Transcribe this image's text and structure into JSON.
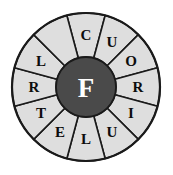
{
  "figure": {
    "name": "letter-wheel",
    "center_letter": "F",
    "sector_count": 12,
    "colors": {
      "sector_fill": "#dedede",
      "hub_fill": "#4a4a4a",
      "outline": "#1a1a1a",
      "sector_letter_color": "#0d0d0d",
      "hub_letter_color": "#ffffff",
      "background": "#ffffff"
    },
    "geometry": {
      "center_x": 86,
      "center_y": 87,
      "outer_radius": 74,
      "hub_radius": 30,
      "letter_radius": 52,
      "sector_span_degrees": 30,
      "first_sector_start_degrees": -15
    },
    "sectors": [
      {
        "index": 0,
        "letter": "C",
        "angle_degrees": 0,
        "empty": false
      },
      {
        "index": 1,
        "letter": "U",
        "angle_degrees": 30,
        "empty": false
      },
      {
        "index": 2,
        "letter": "O",
        "angle_degrees": 60,
        "empty": false
      },
      {
        "index": 3,
        "letter": "R",
        "angle_degrees": 90,
        "empty": false
      },
      {
        "index": 4,
        "letter": "I",
        "angle_degrees": 120,
        "empty": false
      },
      {
        "index": 5,
        "letter": "U",
        "angle_degrees": 150,
        "empty": false
      },
      {
        "index": 6,
        "letter": "L",
        "angle_degrees": 180,
        "empty": false
      },
      {
        "index": 7,
        "letter": "E",
        "angle_degrees": 210,
        "empty": false
      },
      {
        "index": 8,
        "letter": "T",
        "angle_degrees": 240,
        "empty": false
      },
      {
        "index": 9,
        "letter": "R",
        "angle_degrees": 270,
        "empty": false
      },
      {
        "index": 10,
        "letter": "L",
        "angle_degrees": 300,
        "empty": false
      },
      {
        "index": 11,
        "letter": "",
        "angle_degrees": 330,
        "empty": true
      }
    ]
  }
}
